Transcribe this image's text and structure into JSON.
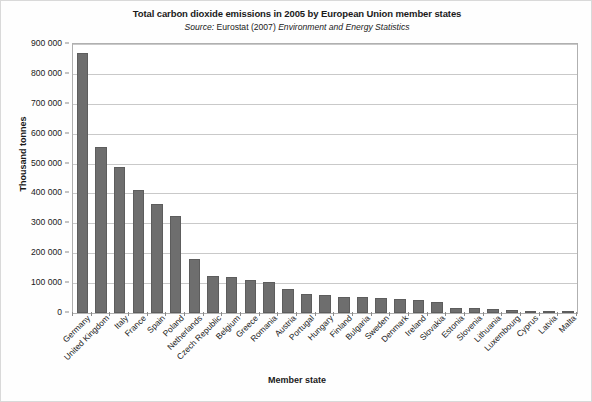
{
  "chart_data": {
    "type": "bar",
    "title": "Total carbon dioxide emissions in 2005 by European Union member states",
    "subtitle_source_label": "Source:",
    "subtitle_publisher": "Eurostat (2007)",
    "subtitle_publication": "Environment and Energy Statistics",
    "xlabel": "Member state",
    "ylabel": "Thousand tonnes",
    "ylim": [
      0,
      900000
    ],
    "ytick_labels": [
      "900 000",
      "800 000",
      "700 000",
      "600 000",
      "500 000",
      "400 000",
      "300 000",
      "200 000",
      "100 000",
      "0"
    ],
    "ytick_values": [
      900000,
      800000,
      700000,
      600000,
      500000,
      400000,
      300000,
      200000,
      100000,
      0
    ],
    "grid": true,
    "legend": "none",
    "bar_color": "#6e6e6e",
    "categories": [
      "Germany",
      "United Kingdom",
      "Italy",
      "France",
      "Spain",
      "Poland",
      "Netherlands",
      "Czech Republic",
      "Belgium",
      "Greece",
      "Romania",
      "Austria",
      "Portugal",
      "Hungary",
      "Finland",
      "Bulgaria",
      "Sweden",
      "Denmark",
      "Ireland",
      "Slovakia",
      "Estonia",
      "Slovenia",
      "Lithuania",
      "Luxembourg",
      "Cyprus",
      "Latvia",
      "Malta"
    ],
    "values": [
      870000,
      555000,
      490000,
      410000,
      365000,
      325000,
      180000,
      125000,
      122000,
      110000,
      105000,
      80000,
      65000,
      60000,
      55000,
      52000,
      50000,
      48000,
      45000,
      38000,
      17000,
      16000,
      14000,
      11000,
      8000,
      7000,
      2500
    ]
  }
}
